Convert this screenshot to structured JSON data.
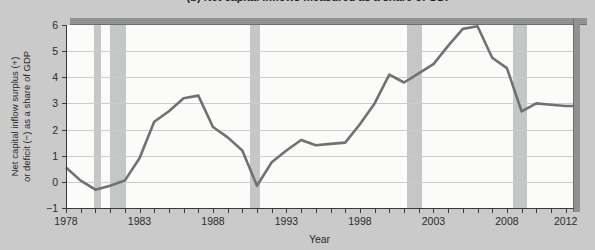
{
  "figure": {
    "title": "(b) Net capital inflows measured as a share of GDP",
    "ylabel_line1": "Net capital inflow surplus (+)",
    "ylabel_line2": "or deficit (−) as a share of GDP",
    "xlabel": "Year"
  },
  "chart_data": {
    "type": "line",
    "title": "(b) Net capital inflows measured as a share of GDP",
    "xlabel": "Year",
    "ylabel": "Net capital inflow surplus (+) or deficit (−) as a share of GDP",
    "x": [
      1978,
      1979,
      1980,
      1981,
      1982,
      1983,
      1984,
      1985,
      1986,
      1987,
      1988,
      1989,
      1990,
      1991,
      1992,
      1993,
      1994,
      1995,
      1996,
      1997,
      1998,
      1999,
      2000,
      2001,
      2002,
      2003,
      2004,
      2005,
      2006,
      2007,
      2008,
      2009,
      2010,
      2011,
      2012
    ],
    "values": [
      0.55,
      0.05,
      -0.3,
      -0.15,
      0.05,
      0.9,
      2.3,
      2.7,
      3.2,
      3.3,
      2.1,
      1.7,
      1.2,
      -0.15,
      0.75,
      1.2,
      1.6,
      1.4,
      1.45,
      1.5,
      2.2,
      3.0,
      4.1,
      3.8,
      4.15,
      4.5,
      5.2,
      5.85,
      5.95,
      4.75,
      4.35,
      2.7,
      3.0,
      2.95,
      2.9
    ],
    "xlim": [
      1978,
      2012.5
    ],
    "ylim": [
      -1,
      6
    ],
    "yticks": [
      -1,
      0,
      1,
      2,
      3,
      4,
      5,
      6
    ],
    "gridline_values": [
      0,
      1,
      2,
      3,
      4,
      5
    ],
    "xtick_labels": [
      1978,
      1983,
      1988,
      1993,
      1998,
      2003,
      2008,
      2012
    ],
    "recession_bands": [
      [
        1979.9,
        1980.4
      ],
      [
        1981.0,
        1982.1
      ],
      [
        1990.5,
        1991.2
      ],
      [
        2001.2,
        2002.2
      ],
      [
        2008.4,
        2009.4
      ]
    ],
    "grid": "horizontal",
    "legend": "none",
    "line_color": "#6f7271",
    "band_color": "#c4c7c6",
    "background_color": "#c9cac9",
    "plot_background_color": "#fbfbf9",
    "frame_color": "#8f9291",
    "text_color": "#2b2b2b"
  }
}
